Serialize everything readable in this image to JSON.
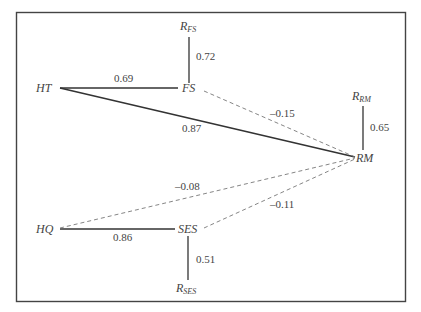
{
  "diagram": {
    "type": "path-diagram",
    "frame": {
      "x": 16,
      "y": 12,
      "width": 390,
      "height": 290
    },
    "colors": {
      "solid_line": "#333333",
      "dashed_line": "#777777",
      "frame": "#444444",
      "text": "#444444"
    },
    "nodes": [
      {
        "id": "HT",
        "label": "HT",
        "x": 36,
        "y": 92
      },
      {
        "id": "FS",
        "label": "FS",
        "x": 190,
        "y": 92
      },
      {
        "id": "RM",
        "label": "RM",
        "x": 367,
        "y": 162
      },
      {
        "id": "HQ",
        "label": "HQ",
        "x": 36,
        "y": 233
      },
      {
        "id": "SES",
        "label": "SES",
        "x": 186,
        "y": 233
      },
      {
        "id": "R_FS",
        "label": "R",
        "subscript": "FS",
        "x": 184,
        "y": 30
      },
      {
        "id": "R_RM",
        "label": "R",
        "subscript": "RM",
        "x": 355,
        "y": 100
      },
      {
        "id": "R_SES",
        "label": "R",
        "subscript": "SES",
        "x": 178,
        "y": 293
      }
    ],
    "edges": [
      {
        "from": "HT",
        "to": "FS",
        "coefficient": "0.69",
        "style": "solid",
        "label_x": 125,
        "label_y": 82
      },
      {
        "from": "HT",
        "to": "RM",
        "coefficient": "0.87",
        "style": "solid",
        "label_x": 183,
        "label_y": 132
      },
      {
        "from": "FS",
        "to": "RM",
        "coefficient": "–0.15",
        "style": "dashed",
        "label_x": 281,
        "label_y": 116
      },
      {
        "from": "R_FS",
        "to": "FS",
        "coefficient": "0.72",
        "style": "solid",
        "label_x": 196,
        "label_y": 60
      },
      {
        "from": "R_RM",
        "to": "RM",
        "coefficient": "0.65",
        "style": "solid",
        "label_x": 370,
        "label_y": 131
      },
      {
        "from": "HQ",
        "to": "RM",
        "coefficient": "–0.08",
        "style": "dashed",
        "label_x": 177,
        "label_y": 190
      },
      {
        "from": "HQ",
        "to": "SES",
        "coefficient": "0.86",
        "style": "solid",
        "label_x": 114,
        "label_y": 240
      },
      {
        "from": "SES",
        "to": "RM",
        "coefficient": "–0.11",
        "style": "dashed",
        "label_x": 271,
        "label_y": 207
      },
      {
        "from": "R_SES",
        "to": "SES",
        "coefficient": "0.51",
        "style": "solid",
        "label_x": 196,
        "label_y": 263
      }
    ]
  }
}
